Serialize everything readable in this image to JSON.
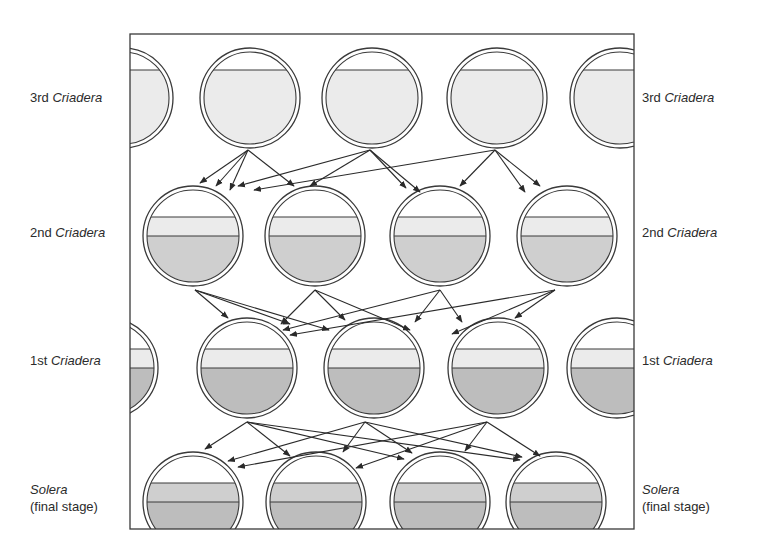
{
  "diagram": {
    "title_fragment": "",
    "frame": {
      "x": 130,
      "y": 34,
      "w": 504,
      "h": 495,
      "stroke": "#3a3a3a"
    },
    "colors": {
      "empty": "#ffffff",
      "light_fill": "#ebebeb",
      "medium_fill": "#cfcfcf",
      "dark_fill": "#bdbdbd",
      "outline": "#3a3a3a",
      "arrow": "#2a2a2a"
    },
    "rows": [
      {
        "id": "third",
        "label_prefix": "3rd ",
        "label_italic": "Criadera",
        "label_y": 89,
        "cy": 98,
        "r": 50,
        "cx": [
          123,
          250,
          372,
          497,
          620
        ],
        "bands": [
          {
            "from": -28,
            "to": 50,
            "fill": "light_fill"
          }
        ]
      },
      {
        "id": "second",
        "label_prefix": "2nd ",
        "label_italic": "Criadera",
        "label_y": 224,
        "cy": 236,
        "r": 50,
        "cx": [
          193,
          315,
          440,
          567
        ],
        "bands": [
          {
            "from": -19,
            "to": 0,
            "fill": "light_fill"
          },
          {
            "from": 0,
            "to": 50,
            "fill": "medium_fill"
          }
        ]
      },
      {
        "id": "first",
        "label_prefix": "1st ",
        "label_italic": "Criadera",
        "label_y": 352,
        "cy": 368,
        "r": 50,
        "cx": [
          108,
          247,
          374,
          498,
          617
        ],
        "bands": [
          {
            "from": -19,
            "to": 0,
            "fill": "light_fill"
          },
          {
            "from": 0,
            "to": 50,
            "fill": "dark_fill"
          }
        ]
      },
      {
        "id": "solera",
        "label_prefix": "",
        "label_italic": "Solera",
        "label_sub": "(final stage)",
        "label_y": 481,
        "cy": 502,
        "r": 50,
        "cx": [
          193,
          316,
          440,
          556
        ],
        "bands": [
          {
            "from": -19,
            "to": 0,
            "fill": "medium_fill"
          },
          {
            "from": 0,
            "to": 50,
            "fill": "dark_fill"
          }
        ]
      }
    ],
    "transfers": [
      {
        "from_y": 150,
        "sources": [
          248,
          370,
          495
        ],
        "targets": [
          [
            [
              200,
              183
            ],
            [
              216,
              186
            ],
            [
              230,
              190
            ],
            [
              294,
              186
            ]
          ],
          [
            [
              238,
              186
            ],
            [
              310,
              186
            ],
            [
              406,
              188
            ],
            [
              420,
              192
            ]
          ],
          [
            [
              254,
              190
            ],
            [
              460,
              186
            ],
            [
              525,
              192
            ],
            [
              540,
              186
            ]
          ]
        ]
      },
      {
        "from_y": 290,
        "sources": [
          195,
          315,
          440,
          555
        ],
        "targets": [
          [
            [
              228,
              318
            ],
            [
              290,
              324
            ],
            [
              329,
              330
            ]
          ],
          [
            [
              281,
              324
            ],
            [
              345,
              320
            ],
            [
              410,
              330
            ]
          ],
          [
            [
              283,
              330
            ],
            [
              415,
              322
            ],
            [
              462,
              322
            ]
          ],
          [
            [
              290,
              335
            ],
            [
              452,
              334
            ],
            [
              515,
              318
            ]
          ]
        ]
      },
      {
        "from_y": 422,
        "sources": [
          247,
          365,
          487
        ],
        "targets": [
          [
            [
              205,
              449
            ],
            [
              290,
              456
            ],
            [
              404,
              459
            ],
            [
              520,
              460
            ]
          ],
          [
            [
              228,
              461
            ],
            [
              343,
              452
            ],
            [
              412,
              453
            ],
            [
              522,
              457
            ]
          ],
          [
            [
              238,
              467
            ],
            [
              356,
              468
            ],
            [
              465,
              451
            ],
            [
              540,
              456
            ]
          ]
        ]
      }
    ]
  }
}
